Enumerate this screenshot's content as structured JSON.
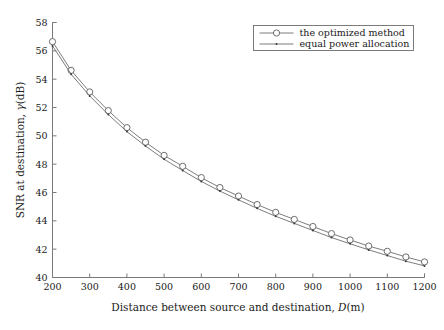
{
  "chart_data": {
    "type": "line",
    "title": "",
    "xlabel": "Distance between source and destination, D(m)",
    "xlabel_prefix": "Distance between source and destination, ",
    "xlabel_symbol": "D",
    "xlabel_suffix": "(m)",
    "ylabel": "SNR at destination, γ(dB)",
    "ylabel_prefix": "SNR at destination, ",
    "ylabel_symbol": "γ",
    "ylabel_suffix": "(dB)",
    "xlim": [
      200,
      1200
    ],
    "ylim": [
      40,
      58
    ],
    "xticks": [
      200,
      300,
      400,
      500,
      600,
      700,
      800,
      900,
      1000,
      1100,
      1200
    ],
    "yticks": [
      40,
      42,
      44,
      46,
      48,
      50,
      52,
      54,
      56,
      58
    ],
    "xtick_labels": [
      "200",
      "300",
      "400",
      "500",
      "600",
      "700",
      "800",
      "900",
      "1000",
      "1100",
      "1200"
    ],
    "ytick_labels": [
      "40",
      "42",
      "44",
      "46",
      "48",
      "50",
      "52",
      "54",
      "56",
      "58"
    ],
    "grid": false,
    "legend_position": "top-right",
    "x": [
      200,
      250,
      300,
      350,
      400,
      450,
      500,
      550,
      600,
      650,
      700,
      750,
      800,
      850,
      900,
      950,
      1000,
      1050,
      1100,
      1150,
      1200
    ],
    "series": [
      {
        "name": "the optimized method",
        "marker": "circle",
        "color": "#6e6e6e",
        "values": [
          56.65,
          54.62,
          53.1,
          51.78,
          50.58,
          49.55,
          48.62,
          47.85,
          47.05,
          46.35,
          45.75,
          45.15,
          44.6,
          44.1,
          43.6,
          43.1,
          42.65,
          42.22,
          41.85,
          41.45,
          41.1
        ]
      },
      {
        "name": "equal power allocation",
        "marker": "dot",
        "color": "#6e6e6e",
        "values": [
          56.35,
          54.35,
          52.82,
          51.5,
          50.3,
          49.28,
          48.35,
          47.55,
          46.78,
          46.1,
          45.48,
          44.88,
          44.32,
          43.82,
          43.32,
          42.82,
          42.38,
          41.95,
          41.55,
          41.15,
          40.82
        ]
      }
    ],
    "legend_entries": [
      {
        "label": "the optimized method",
        "marker": "circle"
      },
      {
        "label": "equal power allocation",
        "marker": "dot"
      }
    ],
    "axis_color": "#7a7a7a",
    "line_color": "#6e6e6e",
    "background": "#ffffff"
  }
}
